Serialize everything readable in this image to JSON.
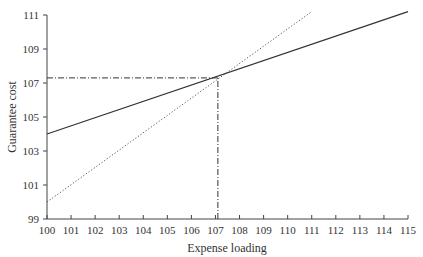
{
  "chart_data": {
    "type": "line",
    "title": "",
    "xlabel": "Expense loading",
    "ylabel": "Guarantee cost",
    "xlim": [
      100,
      115
    ],
    "ylim": [
      99,
      111
    ],
    "x_ticks": [
      100,
      101,
      102,
      103,
      104,
      105,
      106,
      107,
      108,
      109,
      110,
      111,
      112,
      113,
      114,
      115
    ],
    "y_ticks": [
      99,
      101,
      103,
      105,
      107,
      109,
      111
    ],
    "grid": false,
    "legend": null,
    "series": [
      {
        "name": "solid line",
        "style": "solid",
        "x": [
          100,
          115
        ],
        "y": [
          104.0,
          111.2
        ]
      },
      {
        "name": "dotted line",
        "style": "dotted",
        "x": [
          100,
          111.0
        ],
        "y": [
          100.0,
          111.2
        ]
      }
    ],
    "annotations": [
      {
        "type": "reference-line",
        "style": "dash-dot",
        "orientation": "horizontal",
        "y": 107.3,
        "from_x": 100,
        "to_x": 107.1
      },
      {
        "type": "reference-line",
        "style": "dash-dot",
        "orientation": "vertical",
        "x": 107.1,
        "from_y": 99,
        "to_y": 107.3
      }
    ],
    "intersection": {
      "x": 107.1,
      "y": 107.3
    }
  },
  "labels": {
    "xlabel": "Expense loading",
    "ylabel": "Guarantee cost"
  }
}
